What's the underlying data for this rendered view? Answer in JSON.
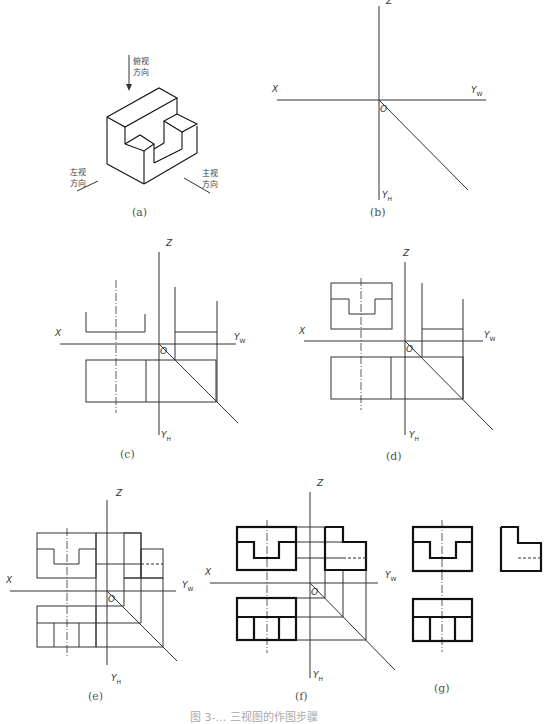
{
  "figure": {
    "caption": "图 3-… 三视图的作图步骤",
    "panels": [
      {
        "id": "a",
        "label": "(a)",
        "notes": {
          "top": [
            "俯视",
            "方向"
          ],
          "left": [
            "左视",
            "方向"
          ],
          "right": [
            "主视",
            "方向"
          ]
        }
      },
      {
        "id": "b",
        "label": "(b)",
        "axes": {
          "z": "Z",
          "x": "X",
          "yw": "Y",
          "yw_sub": "W",
          "yh": "Y",
          "yh_sub": "H",
          "origin": "O"
        }
      },
      {
        "id": "c",
        "label": "(c)",
        "axes": {
          "z": "Z",
          "x": "X",
          "yw": "Y",
          "yw_sub": "W",
          "yh": "Y",
          "yh_sub": "H",
          "origin": "O"
        }
      },
      {
        "id": "d",
        "label": "(d)",
        "axes": {
          "z": "Z",
          "x": "X",
          "yw": "Y",
          "yw_sub": "W",
          "yh": "Y",
          "yh_sub": "H",
          "origin": "O"
        }
      },
      {
        "id": "e",
        "label": "(e)",
        "axes": {
          "z": "Z",
          "x": "X",
          "yw": "Y",
          "yw_sub": "W",
          "yh": "Y",
          "yh_sub": "H",
          "origin": "O"
        }
      },
      {
        "id": "f",
        "label": "(f)",
        "axes": {
          "z": "Z",
          "x": "X",
          "yw": "Y",
          "yw_sub": "W",
          "yh": "Y",
          "yh_sub": "H",
          "origin": "O"
        }
      },
      {
        "id": "g",
        "label": "(g)"
      }
    ]
  }
}
